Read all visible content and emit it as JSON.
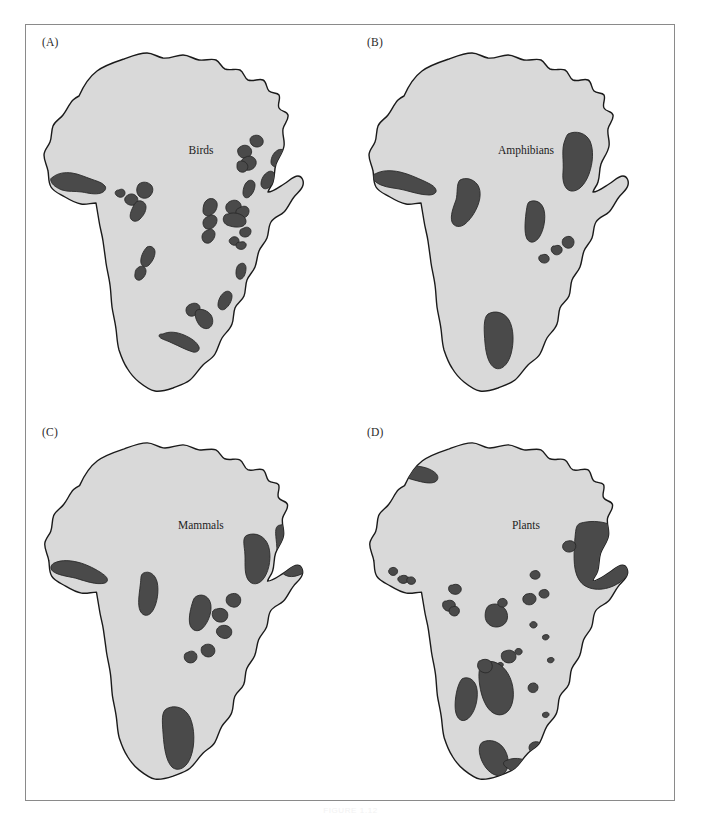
{
  "figure": {
    "caption": "FIGURE 1.12",
    "background_color": "#ffffff",
    "frame_border_color": "#8a8a8a",
    "land_fill_color": "#d9d9d9",
    "land_outline_color": "#1a1a1a",
    "hotspot_fill_color": "#4a4a4a",
    "hotspot_outline_color": "#2b2b2b"
  },
  "panels": [
    {
      "id": "A",
      "label": "(A)",
      "map_title": "Birds",
      "taxon": "Birds",
      "continent": "Africa",
      "hotspot_count": 28,
      "title_x": 176,
      "title_y": 130
    },
    {
      "id": "B",
      "label": "(B)",
      "map_title": "Amphibians",
      "taxon": "Amphibians",
      "continent": "Africa",
      "hotspot_count": 9,
      "title_x": 176,
      "title_y": 130
    },
    {
      "id": "C",
      "label": "(C)",
      "map_title": "Mammals",
      "taxon": "Mammals",
      "continent": "Africa",
      "hotspot_count": 11,
      "title_x": 176,
      "title_y": 116
    },
    {
      "id": "D",
      "label": "(D)",
      "map_title": "Plants",
      "taxon": "Plants",
      "continent": "Africa",
      "hotspot_count": 28,
      "title_x": 176,
      "title_y": 116
    }
  ],
  "map_geometry": {
    "africa_outline": "M 54 72 C 58 63, 64 53, 72 47 C 80 41, 90 38, 99 35 C 107 32, 114 29, 122 29 C 128 29, 132 33, 138 34 C 145 35, 151 31, 158 31 C 164 31, 168 35, 174 36 C 180 37, 186 34, 191 36 C 195 38, 196 43, 200 45 C 205 47, 211 44, 215 46 C 219 48, 219 54, 223 56 C 228 58, 234 54, 238 56 C 242 58, 241 64, 244 67 C 247 70, 252 68, 254 71 C 256 75, 252 80, 254 84 C 256 88, 262 87, 263 91 C 264 96, 259 100, 258 105 C 257 111, 260 116, 259 122 C 258 129, 253 134, 251 140 C 249 146, 250 152, 248 158 C 247 162, 244 164, 243 168 C 248 168, 254 163, 259 160 C 264 157, 268 152, 273 152 C 277 152, 279 157, 278 161 C 277 166, 272 169, 269 173 C 265 178, 263 184, 259 188 C 255 192, 249 193, 246 198 C 243 203, 244 209, 242 214 C 240 219, 236 222, 234 227 C 232 232, 232 238, 230 243 C 228 248, 224 251, 222 256 C 220 261, 221 267, 219 272 C 217 277, 212 279, 210 284 C 208 289, 209 295, 207 300 C 205 306, 200 309, 197 314 C 194 319, 193 325, 190 330 C 187 335, 182 337, 178 341 C 173 346, 170 352, 165 356 C 160 360, 153 362, 148 364 C 142 366, 136 368, 130 367 C 124 366, 119 362, 114 358 C 109 354, 105 349, 102 344 C 98 338, 96 332, 94 326 C 92 319, 92 312, 91 305 C 90 297, 88 290, 87 283 C 86 275, 86 268, 85 261 C 84 253, 82 246, 81 239 C 80 231, 79 224, 78 217 C 77 210, 75 204, 74 197 C 73 191, 72 185, 71 179 C 66 179, 61 181, 56 180 C 50 179, 45 176, 40 173 C 35 170, 29 168, 26 163 C 23 158, 24 152, 23 147 C 22 141, 19 137, 19 131 C 19 126, 23 123, 25 118 C 27 113, 26 107, 28 102 C 30 97, 35 95, 38 91 C 42 86, 44 80, 48 76 C 50 74, 52 73, 54 72 Z",
    "view_box": "0 0 325 390"
  },
  "hotspots": {
    "A": [
      {
        "name": "guinean-forests",
        "d": "M 28 153 C 33 149, 40 148, 47 149 C 54 150, 60 153, 66 155 C 71 157, 77 158, 80 162 C 82 165, 79 168, 76 169 C 70 171, 63 169, 57 168 C 50 167, 43 168, 37 166 C 32 164, 27 161, 26 157 C 25 155, 26 154, 28 153 Z"
      },
      {
        "name": "cameroon-highlands-1",
        "d": "M 114 160 C 118 157, 123 158, 126 161 C 129 164, 128 169, 125 172 C 122 175, 117 175, 114 172 C 111 169, 111 163, 114 160 Z"
      },
      {
        "name": "cameroon-highlands-2",
        "d": "M 103 171 C 106 169, 110 170, 112 173 C 114 176, 112 180, 109 181 C 105 182, 101 180, 100 177 C 99 174, 101 172, 103 171 Z"
      },
      {
        "name": "cameroon-coast",
        "d": "M 113 177 C 117 176, 121 179, 121 183 C 121 188, 118 192, 115 195 C 112 198, 108 198, 106 195 C 104 192, 106 187, 108 183 C 109 180, 111 178, 113 177 Z"
      },
      {
        "name": "ethiopia-highlands-n",
        "d": "M 215 123 C 219 120, 224 121, 226 125 C 228 129, 225 133, 222 134 C 218 135, 214 133, 213 129 C 212 126, 213 124, 215 123 Z"
      },
      {
        "name": "ethiopia-highlands-c",
        "d": "M 221 133 C 225 131, 230 133, 231 137 C 232 141, 229 145, 225 146 C 221 147, 217 145, 216 141 C 215 137, 218 134, 221 133 Z"
      },
      {
        "name": "ethiopia-highlands-s",
        "d": "M 213 138 C 216 136, 220 137, 222 140 C 224 143, 222 147, 219 148 C 215 149, 212 146, 212 143 C 212 140, 212 139, 213 138 Z"
      },
      {
        "name": "somali-coast-n",
        "d": "M 253 126 C 257 124, 262 127, 262 131 C 262 136, 258 140, 254 142 C 250 144, 246 142, 246 138 C 246 133, 249 128, 253 126 Z"
      },
      {
        "name": "somali-coast-s",
        "d": "M 243 148 C 246 146, 250 148, 250 152 C 250 157, 247 162, 243 164 C 240 166, 236 164, 236 160 C 236 155, 239 150, 243 148 Z"
      },
      {
        "name": "eastern-arc-1",
        "d": "M 223 157 C 226 155, 230 157, 230 161 C 230 166, 227 171, 224 173 C 221 175, 218 173, 218 169 C 218 164, 220 159, 223 157 Z"
      },
      {
        "name": "albertine-rift-n",
        "d": "M 182 176 C 186 173, 191 175, 192 179 C 193 184, 190 189, 186 191 C 182 193, 178 191, 178 187 C 178 182, 179 178, 182 176 Z"
      },
      {
        "name": "albertine-rift-c",
        "d": "M 184 192 C 188 190, 192 192, 192 196 C 192 200, 189 204, 185 205 C 181 206, 178 203, 178 199 C 178 195, 181 193, 184 192 Z"
      },
      {
        "name": "albertine-rift-s",
        "d": "M 183 206 C 186 204, 190 206, 190 210 C 190 214, 187 218, 184 219 C 180 220, 177 217, 177 213 C 177 209, 180 207, 183 206 Z"
      },
      {
        "name": "kenya-highlands-1",
        "d": "M 206 177 C 210 175, 215 177, 216 181 C 217 185, 214 189, 210 190 C 206 191, 202 189, 201 185 C 200 181, 203 178, 206 177 Z"
      },
      {
        "name": "kenya-highlands-2",
        "d": "M 216 183 C 220 181, 224 183, 224 187 C 224 191, 221 194, 217 194 C 213 194, 210 191, 211 187 C 211 185, 214 184, 216 183 Z"
      },
      {
        "name": "kenya-highlands-3",
        "d": "M 203 190 C 208 188, 214 189, 218 192 C 222 195, 222 200, 218 202 C 213 204, 207 203, 202 201 C 198 199, 197 194, 200 191 C 201 190, 202 190, 203 190 Z"
      },
      {
        "name": "tanzania-patch-1",
        "d": "M 219 204 C 222 202, 226 204, 226 207 C 226 211, 223 213, 220 213 C 216 213, 214 210, 215 207 C 215 205, 217 205, 219 204 Z"
      },
      {
        "name": "tanzania-patch-2",
        "d": "M 208 213 C 211 212, 214 214, 214 217 C 214 220, 211 222, 208 221 C 205 220, 203 217, 205 215 C 206 214, 207 213, 208 213 Z"
      },
      {
        "name": "tanzania-patch-3",
        "d": "M 216 218 C 219 217, 222 219, 221 222 C 220 225, 217 226, 214 225 C 211 224, 210 221, 212 219 C 213 218, 215 218, 216 218 Z"
      },
      {
        "name": "upper-guinea-patch",
        "d": "M 94 166 C 97 164, 100 166, 100 169 C 100 172, 97 174, 94 173 C 91 172, 89 169, 91 167 C 92 166, 93 166, 94 166 Z"
      },
      {
        "name": "zambezi-patch",
        "d": "M 215 240 C 218 238, 221 240, 221 244 C 221 249, 219 254, 216 255 C 213 256, 211 253, 211 249 C 211 245, 212 241, 215 240 Z"
      },
      {
        "name": "angola-escarpment-1",
        "d": "M 122 223 C 126 221, 130 224, 130 228 C 130 233, 127 238, 124 241 C 121 244, 117 243, 116 239 C 115 234, 118 227, 122 223 Z"
      },
      {
        "name": "angola-escarpment-2",
        "d": "M 114 243 C 117 241, 121 243, 121 247 C 121 251, 118 255, 115 256 C 112 257, 109 254, 110 250 C 110 246, 112 244, 114 243 Z"
      },
      {
        "name": "drakensberg-n",
        "d": "M 200 268 C 203 266, 207 268, 207 272 C 207 277, 204 282, 200 285 C 197 287, 193 285, 193 281 C 193 276, 196 270, 200 268 Z"
      },
      {
        "name": "eastern-zim",
        "d": "M 166 280 C 170 278, 175 280, 175 284 C 175 288, 172 291, 168 292 C 164 293, 161 290, 161 286 C 161 283, 163 281, 166 280 Z"
      },
      {
        "name": "cape-region",
        "d": "M 138 310 C 144 307, 152 308, 159 311 C 166 314, 172 318, 174 323 C 175 326, 172 329, 168 328 C 161 326, 154 322, 147 319 C 141 316, 135 315, 134 312 C 134 310, 136 310, 138 310 Z"
      },
      {
        "name": "albany-thicket",
        "d": "M 172 286 C 177 284, 183 287, 186 291 C 189 296, 188 302, 184 304 C 180 306, 175 303, 173 299 C 170 294, 169 288, 172 286 Z"
      },
      {
        "name": "ethiopia-north-tip",
        "d": "M 228 112 C 232 110, 237 112, 238 116 C 239 120, 236 123, 232 123 C 228 123, 225 120, 225 116 C 225 114, 226 113, 228 112 Z"
      }
    ],
    "B": [
      {
        "name": "guinean-forests",
        "d": "M 25 150 C 32 146, 41 146, 50 148 C 59 150, 67 154, 74 157 C 80 160, 85 162, 86 166 C 87 169, 83 171, 79 171 C 71 171, 62 168, 54 166 C 46 164, 38 164, 31 161 C 26 159, 22 155, 23 152 C 23 151, 24 150, 25 150 Z"
      },
      {
        "name": "cameroon-highlands",
        "d": "M 110 156 C 116 153, 123 155, 127 160 C 131 165, 131 173, 128 181 C 125 189, 120 196, 115 200 C 110 204, 104 203, 102 198 C 100 192, 103 184, 106 176 C 108 169, 106 160, 110 156 Z"
      },
      {
        "name": "ethiopia-highlands",
        "d": "M 218 110 C 226 106, 236 109, 240 117 C 244 126, 243 139, 239 150 C 235 161, 228 168, 221 167 C 215 166, 212 158, 213 148 C 214 137, 211 125, 215 116 C 216 113, 217 111, 218 110 Z"
      },
      {
        "name": "albertine-rift",
        "d": "M 179 178 C 185 175, 192 178, 194 186 C 196 194, 194 205, 190 212 C 186 219, 180 220, 177 215 C 174 209, 175 198, 176 189 C 177 183, 177 180, 179 178 Z"
      },
      {
        "name": "eastern-arc-1",
        "d": "M 216 213 C 220 211, 224 214, 224 218 C 224 222, 221 225, 217 224 C 213 223, 211 219, 213 215 C 214 214, 215 213, 216 213 Z"
      },
      {
        "name": "eastern-arc-2",
        "d": "M 205 222 C 209 220, 213 223, 212 227 C 211 230, 207 232, 204 230 C 201 228, 200 224, 203 222 C 204 222, 204 222, 205 222 Z"
      },
      {
        "name": "eastern-arc-3",
        "d": "M 192 231 C 196 229, 200 232, 199 236 C 198 239, 194 240, 191 238 C 188 236, 188 232, 191 231 C 191 231, 192 231, 192 231 Z"
      },
      {
        "name": "cape-region",
        "d": "M 138 290 C 145 286, 154 288, 159 296 C 164 305, 164 319, 161 330 C 158 341, 151 347, 145 344 C 139 341, 136 331, 135 319 C 134 307, 133 294, 138 290 Z"
      },
      {
        "name": "southern-cape-tip",
        "d": "M 192 335 C 196 333, 200 336, 199 340 C 198 343, 194 344, 191 342 C 188 340, 189 336, 192 335 Z"
      }
    ],
    "C": [
      {
        "name": "guinean-forests",
        "d": "M 28 150 C 36 146, 46 147, 56 150 C 65 153, 74 158, 79 162 C 83 165, 83 169, 79 170 C 71 172, 60 168, 50 165 C 41 163, 32 162, 27 158 C 24 155, 25 152, 28 150 Z"
      },
      {
        "name": "cameroon-highlands",
        "d": "M 118 160 C 124 157, 130 161, 132 169 C 134 178, 132 190, 128 197 C 124 204, 118 204, 115 198 C 112 192, 114 181, 115 172 C 116 165, 115 162, 118 160 Z"
      },
      {
        "name": "ethiopia-highlands",
        "d": "M 222 122 C 231 118, 241 123, 244 133 C 247 143, 245 156, 240 164 C 235 172, 227 173, 223 166 C 219 159, 221 148, 220 138 C 219 130, 218 124, 222 122 Z"
      },
      {
        "name": "horn-of-africa",
        "d": "M 254 112 C 268 108, 284 113, 292 124 C 298 133, 294 146, 285 155 C 276 164, 264 166, 258 160 C 252 154, 253 141, 252 130 C 251 120, 250 114, 254 112 Z"
      },
      {
        "name": "albertine-rift",
        "d": "M 172 183 C 178 180, 185 184, 186 192 C 187 200, 183 210, 178 215 C 173 220, 167 218, 165 212 C 163 205, 166 194, 168 188 C 169 185, 170 184, 172 183 Z"
      },
      {
        "name": "eastern-arc-1",
        "d": "M 206 181 C 211 179, 216 182, 216 187 C 216 192, 212 195, 208 194 C 203 193, 200 189, 202 184 C 203 182, 204 182, 206 181 Z"
      },
      {
        "name": "eastern-arc-2",
        "d": "M 192 196 C 197 194, 203 197, 203 202 C 203 207, 199 210, 194 209 C 189 208, 186 203, 188 198 C 189 197, 190 196, 192 196 Z"
      },
      {
        "name": "eastern-arc-3",
        "d": "M 196 213 C 201 211, 207 214, 207 219 C 207 224, 202 227, 197 225 C 192 223, 190 218, 193 215 C 194 214, 195 213, 196 213 Z"
      },
      {
        "name": "eastern-arc-4",
        "d": "M 180 232 C 185 230, 190 233, 190 238 C 190 242, 186 245, 182 244 C 177 243, 175 238, 177 234 C 178 233, 179 233, 180 232 Z"
      },
      {
        "name": "eastern-arc-5",
        "d": "M 164 239 C 168 237, 172 240, 172 244 C 172 248, 168 251, 164 250 C 160 249, 158 245, 160 241 C 161 240, 162 240, 164 239 Z"
      },
      {
        "name": "cape-region",
        "d": "M 142 296 C 150 292, 160 295, 165 305 C 170 316, 170 333, 166 344 C 162 356, 153 360, 147 355 C 141 349, 139 336, 138 322 C 137 308, 136 299, 142 296 Z"
      }
    ],
    "D": [
      {
        "name": "mediterranean-morocco",
        "d": "M 52 55 C 60 51, 70 52, 78 55 C 85 58, 89 62, 87 66 C 85 70, 78 70, 70 68 C 62 66, 54 64, 50 61 C 47 59, 48 56, 52 55 Z"
      },
      {
        "name": "canary-islands-1",
        "d": "M 40 155 C 43 153, 47 155, 47 158 C 47 161, 44 163, 41 162 C 38 161, 37 157, 39 156 C 39 155, 40 155, 40 155 Z"
      },
      {
        "name": "cape-verde",
        "d": "M 50 163 C 54 161, 58 163, 58 166 C 58 169, 54 171, 51 170 C 48 169, 46 166, 48 164 C 49 163, 49 163, 50 163 Z"
      },
      {
        "name": "guinea-patch",
        "d": "M 59 164 C 62 163, 65 165, 65 168 C 65 170, 62 172, 59 171 C 57 170, 55 167, 57 165 C 57 164, 58 164, 59 164 Z"
      },
      {
        "name": "togo-gap",
        "d": "M 102 172 C 106 170, 111 172, 111 176 C 111 180, 107 182, 103 181 C 99 180, 97 176, 99 173 C 100 172, 101 172, 102 172 Z"
      },
      {
        "name": "cameroon-patch-1",
        "d": "M 96 188 C 100 186, 105 188, 105 192 C 105 196, 101 199, 97 198 C 93 197, 91 192, 93 189 C 94 188, 95 188, 96 188 Z"
      },
      {
        "name": "cameroon-patch-2",
        "d": "M 102 194 C 106 192, 110 195, 109 199 C 108 203, 104 204, 101 202 C 98 200, 98 196, 101 194 C 101 194, 102 194, 102 194 Z"
      },
      {
        "name": "congo-basin-1",
        "d": "M 140 192 C 147 189, 155 193, 157 200 C 159 207, 155 213, 148 214 C 141 215, 135 210, 135 203 C 135 197, 137 193, 140 192 Z"
      },
      {
        "name": "congo-basin-2",
        "d": "M 150 186 C 154 184, 158 187, 157 191 C 156 194, 152 195, 149 193 C 147 191, 147 188, 150 186 Z"
      },
      {
        "name": "eastern-congo",
        "d": "M 177 181 C 182 179, 187 182, 186 187 C 185 191, 180 193, 176 191 C 172 189, 172 184, 175 182 C 176 181, 176 181, 177 181 Z"
      },
      {
        "name": "uganda-patch",
        "d": "M 183 158 C 187 156, 191 159, 190 163 C 189 166, 185 167, 182 165 C 179 163, 180 159, 183 158 Z"
      },
      {
        "name": "kenya-patch",
        "d": "M 192 177 C 196 175, 200 178, 199 182 C 198 185, 194 186, 191 184 C 188 182, 189 178, 192 177 Z"
      },
      {
        "name": "horn-of-africa",
        "d": "M 230 110 C 250 104, 272 112, 282 128 C 290 141, 285 158, 272 168 C 259 178, 241 179, 232 170 C 223 161, 224 143, 225 128 C 226 117, 226 112, 230 110 Z"
      },
      {
        "name": "ethiopia-patch",
        "d": "M 217 128 C 222 126, 227 129, 226 134 C 225 138, 220 140, 216 138 C 212 136, 212 131, 215 129 C 216 128, 216 128, 217 128 Z"
      },
      {
        "name": "tanzania-dot-1",
        "d": "M 182 209 C 185 208, 188 210, 187 213 C 186 215, 183 216, 181 214 C 179 212, 180 210, 182 209 Z"
      },
      {
        "name": "tanzania-dot-2",
        "d": "M 195 222 C 198 221, 200 223, 199 225 C 198 227, 195 228, 193 226 C 192 224, 193 222, 195 222 Z"
      },
      {
        "name": "zambia-patch",
        "d": "M 156 238 C 161 236, 166 239, 166 244 C 166 248, 162 251, 157 250 C 152 249, 150 244, 152 240 C 153 239, 155 238, 156 238 Z"
      },
      {
        "name": "malawi-dot",
        "d": "M 167 236 C 170 235, 173 237, 172 240 C 171 242, 168 243, 166 241 C 164 239, 165 237, 167 236 Z"
      },
      {
        "name": "zambezi-dot",
        "d": "M 149 250 C 152 249, 154 251, 153 253 C 152 255, 149 256, 147 254 C 146 252, 147 251, 149 250 Z"
      },
      {
        "name": "maputaland",
        "d": "M 181 271 C 185 269, 189 272, 188 276 C 187 280, 183 281, 180 279 C 177 277, 178 272, 181 271 Z"
      },
      {
        "name": "angola-escarpment",
        "d": "M 112 266 C 119 263, 126 268, 127 278 C 128 289, 124 301, 118 306 C 112 311, 106 307, 105 297 C 104 287, 107 271, 112 266 Z"
      },
      {
        "name": "zambezian-woodland",
        "d": "M 134 250 C 142 246, 152 251, 158 261 C 164 271, 165 285, 161 294 C 157 303, 148 305, 141 299 C 134 293, 130 280, 129 268 C 128 257, 130 252, 134 250 Z"
      },
      {
        "name": "zambezian-arm",
        "d": "M 130 248 C 135 245, 141 247, 142 252 C 143 257, 139 261, 134 260 C 129 259, 126 254, 128 250 C 128 249, 129 248, 130 248 Z"
      },
      {
        "name": "cape-floristic",
        "d": "M 132 330 C 140 326, 150 329, 155 338 C 160 347, 159 358, 153 362 C 147 366, 139 361, 134 353 C 129 345, 127 334, 132 330 Z"
      },
      {
        "name": "south-coast-1",
        "d": "M 157 348 C 166 344, 177 347, 183 353 C 188 358, 186 364, 179 364 C 171 364, 162 359, 156 355 C 152 352, 153 349, 157 348 Z"
      },
      {
        "name": "succulent-karoo",
        "d": "M 183 330 C 188 328, 193 331, 192 336 C 191 340, 186 342, 182 340 C 178 338, 178 332, 183 330 Z"
      },
      {
        "name": "albany-dot",
        "d": "M 195 300 C 198 299, 200 301, 199 303 C 198 305, 195 306, 193 304 C 192 302, 193 300, 195 300 Z"
      },
      {
        "name": "east-coast-dot",
        "d": "M 200 245 C 203 244, 205 246, 204 248 C 203 250, 200 251, 198 249 C 197 247, 198 245, 200 245 Z"
      }
    ]
  }
}
